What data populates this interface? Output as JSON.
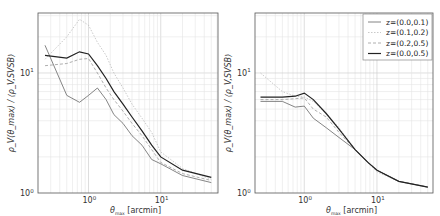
{
  "chart_data": [
    {
      "type": "line",
      "panel": "left",
      "xscale": "log",
      "yscale": "log",
      "xlim": [
        0.2,
        62
      ],
      "ylim": [
        1,
        31.6
      ],
      "grid": true,
      "xlabel": "θ_max [arcmin]",
      "ylabel": "ρ_V(θ_max) / ⟨ρ_V,SVSB⟩",
      "xticks": [
        "10^0",
        "10^1"
      ],
      "yticks": [
        "10^0",
        "10^1"
      ],
      "x": [
        0.25,
        0.5,
        0.75,
        1.0,
        1.33,
        1.75,
        2.25,
        3,
        4,
        5.5,
        7.5,
        10,
        20,
        50
      ],
      "series": [
        {
          "name": "z=(0.0,0.1)",
          "style": "thin-solid",
          "values": [
            17,
            6.5,
            5.7,
            6.5,
            7.5,
            6.0,
            4.5,
            3.8,
            3.0,
            2.5,
            1.9,
            1.75,
            1.4,
            1.22
          ]
        },
        {
          "name": "z=(0.1,0.2)",
          "style": "dotted",
          "values": [
            13,
            20,
            28,
            25,
            18,
            14,
            10,
            7.5,
            5.5,
            4.2,
            3.2,
            2.2,
            1.6,
            1.3
          ]
        },
        {
          "name": "z=(0.2,0.5)",
          "style": "dashed",
          "values": [
            11.5,
            12,
            13,
            13.2,
            10,
            7.5,
            6,
            4.8,
            3.8,
            3.0,
            2.3,
            1.8,
            1.45,
            1.27
          ]
        },
        {
          "name": "z=(0.0,0.5)",
          "style": "thick-solid",
          "values": [
            14,
            13.3,
            15,
            14.4,
            11.5,
            9,
            7,
            5.5,
            4.3,
            3.3,
            2.5,
            2.0,
            1.55,
            1.35
          ]
        }
      ]
    },
    {
      "type": "line",
      "panel": "right",
      "xscale": "log",
      "yscale": "log",
      "xlim": [
        0.21,
        59
      ],
      "ylim": [
        1,
        31.6
      ],
      "grid": true,
      "legend_position": "upper right",
      "xlabel": "θ_max [arcmin]",
      "ylabel": "ρ_V(θ_max) / ⟨ρ_V,SVSB⟩",
      "xticks": [
        "10^0",
        "10^1"
      ],
      "yticks": [
        "10^0",
        "10^1"
      ],
      "x": [
        0.25,
        0.5,
        0.75,
        1.0,
        1.33,
        2,
        3,
        5,
        7.5,
        10,
        20,
        50
      ],
      "series": [
        {
          "name": "z=(0.0,0.1)",
          "style": "thin-solid",
          "values": [
            5.8,
            5.8,
            5.2,
            5.3,
            4.2,
            3.5,
            2.9,
            2.3,
            1.8,
            1.55,
            1.25,
            1.12
          ]
        },
        {
          "name": "z=(0.1,0.2)",
          "style": "dotted",
          "values": [
            10,
            7,
            6.4,
            6.3,
            5.8,
            4.6,
            3.5,
            2.3,
            1.8,
            1.5,
            1.25,
            1.12
          ]
        },
        {
          "name": "z=(0.2,0.5)",
          "style": "dashed",
          "values": [
            6.0,
            6.0,
            6.1,
            6.2,
            5.0,
            4.3,
            3.2,
            2.3,
            1.8,
            1.55,
            1.25,
            1.12
          ]
        },
        {
          "name": "z=(0.0,0.5)",
          "style": "thick-solid",
          "values": [
            6.3,
            6.3,
            6.4,
            6.8,
            6.0,
            4.6,
            3.4,
            2.3,
            1.8,
            1.55,
            1.25,
            1.12
          ]
        }
      ]
    }
  ],
  "labels": {
    "xlabel_main": "θ",
    "xlabel_sub": "max",
    "xlabel_unit": " [arcmin]",
    "ylabel": "ρ_V(θ_max) / ⟨ρ_V,SVSB⟩",
    "ytick_top": "10",
    "ytick_bottom": "10",
    "ytick_top_exp": "1",
    "ytick_bottom_exp": "0",
    "xtick_1": "10",
    "xtick_1_exp": "0",
    "xtick_2": "10",
    "xtick_2_exp": "1"
  },
  "legend": [
    {
      "label": "z=(0.0,0.1)"
    },
    {
      "label": "z=(0.1,0.2)"
    },
    {
      "label": "z=(0.2,0.5)"
    },
    {
      "label": "z=(0.0,0.5)"
    }
  ],
  "styles": {
    "thin-solid": {
      "color": "#666666",
      "width": 0.8,
      "dash": ""
    },
    "dotted": {
      "color": "#bbbbbb",
      "width": 0.8,
      "dash": "1.5,1.5"
    },
    "dashed": {
      "color": "#999999",
      "width": 0.8,
      "dash": "3,2"
    },
    "thick-solid": {
      "color": "#222222",
      "width": 1.2,
      "dash": ""
    }
  }
}
